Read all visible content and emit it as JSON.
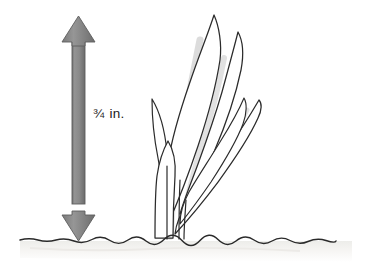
{
  "figure": {
    "background_color": "#ffffff",
    "width": 375,
    "height": 270
  },
  "measurement": {
    "value": "¾",
    "unit": "in.",
    "full_label": "¾ in.",
    "arrow_name": "double-headed-vertical-dimension-arrow",
    "arrow_fill_color": "#8a8a8a",
    "arrow_edge_color": "#5e5e5e",
    "arrow_top_y": 16,
    "arrow_bottom_y": 241,
    "arrow_center_x": 78.5,
    "shaft_width": 13,
    "head_width": 33,
    "head_height": 26
  },
  "ground": {
    "name": "soil-ground-line",
    "line_color": "#2a2a2a",
    "y": 240,
    "x_start": 20,
    "x_end": 352,
    "shading_color": "#f2f1ef"
  },
  "plant": {
    "name": "seedling-plant",
    "outline_color": "#2b2b2b",
    "fill_color": "#ffffff",
    "shade_color": "#d9d9d9",
    "leaf_count": 6,
    "top_y": 14,
    "base_y": 240,
    "left_x": 140,
    "right_x": 264,
    "leaves": [
      {
        "name": "leaf-tall-center",
        "tip_x": 214,
        "tip_y": 14
      },
      {
        "name": "leaf-upper-right",
        "tip_x": 238,
        "tip_y": 31
      },
      {
        "name": "leaf-mid-right",
        "tip_x": 259,
        "tip_y": 99
      },
      {
        "name": "leaf-lower-right",
        "tip_x": 244,
        "tip_y": 97
      },
      {
        "name": "leaf-left-small",
        "tip_x": 152,
        "tip_y": 98
      },
      {
        "name": "leaf-stem-front",
        "tip_x": 168,
        "tip_y": 140
      }
    ]
  }
}
